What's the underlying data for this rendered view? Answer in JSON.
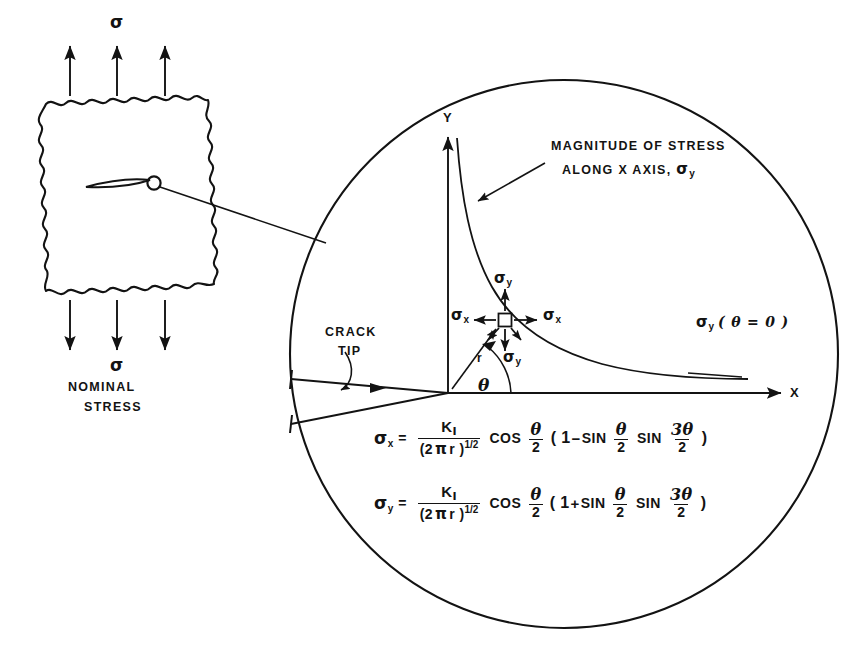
{
  "diagram": {
    "title_absent": true,
    "left_panel": {
      "top_stress_symbol": "σ",
      "bottom_stress_symbol": "σ",
      "caption_line1": "NOMINAL",
      "caption_line2": "STRESS",
      "arrow_count_top": 3,
      "arrow_count_bottom": 3,
      "plate_shape": "wavy-square-plate",
      "crack_shape": "lens-shaped-crack",
      "crack_tip_marker": "small-circle"
    },
    "detail_circle": {
      "axis_y_label": "Y",
      "axis_x_label": "X",
      "curve_annotation_line1": "MAGNITUDE OF STRESS",
      "curve_annotation_line2a": "ALONG X AXIS, ",
      "curve_annotation_line2b": "σ",
      "curve_annotation_line2b_sub": "y",
      "curve_right_label_sigma": "σ",
      "curve_right_label_sub": "y",
      "curve_right_label_arg": "( θ = 0 )",
      "crack_tip_label_line1": "CRACK",
      "crack_tip_label_line2": "TIP",
      "element_sigma_y_top": "σ",
      "element_sigma_y_top_sub": "y",
      "element_sigma_y_bottom": "σ",
      "element_sigma_y_bottom_sub": "y",
      "element_sigma_x_left": "σ",
      "element_sigma_x_left_sub": "x",
      "element_sigma_x_right": "σ",
      "element_sigma_x_right_sub": "x",
      "radius_label": "r",
      "angle_label": "θ"
    },
    "equations": [
      {
        "lhs_sigma": "σ",
        "lhs_sub": "x",
        "equals": "=",
        "numerator": "K",
        "numerator_sub": "I",
        "denominator_open": "(2",
        "denominator_pi": "π",
        "denominator_r": "r )",
        "denominator_exp": "1/2",
        "fn1": "COS",
        "frac1_num": "θ",
        "frac1_den": "2",
        "group_open": "( 1",
        "group_sign": "−",
        "fn2": "SIN",
        "frac2_num": "θ",
        "frac2_den": "2",
        "fn3": "SIN",
        "frac3_num": "3θ",
        "frac3_den": "2",
        "group_close": ")"
      },
      {
        "lhs_sigma": "σ",
        "lhs_sub": "y",
        "equals": "=",
        "numerator": "K",
        "numerator_sub": "I",
        "denominator_open": "(2",
        "denominator_pi": "π",
        "denominator_r": "r )",
        "denominator_exp": "1/2",
        "fn1": "COS",
        "frac1_num": "θ",
        "frac1_den": "2",
        "group_open": "( 1",
        "group_sign": "+",
        "fn2": "SIN",
        "frac2_num": "θ",
        "frac2_den": "2",
        "fn3": "SIN",
        "frac3_num": "3θ",
        "frac3_den": "2",
        "group_close": ")"
      }
    ],
    "colors": {
      "ink": "#131313",
      "background": "#ffffff"
    }
  }
}
